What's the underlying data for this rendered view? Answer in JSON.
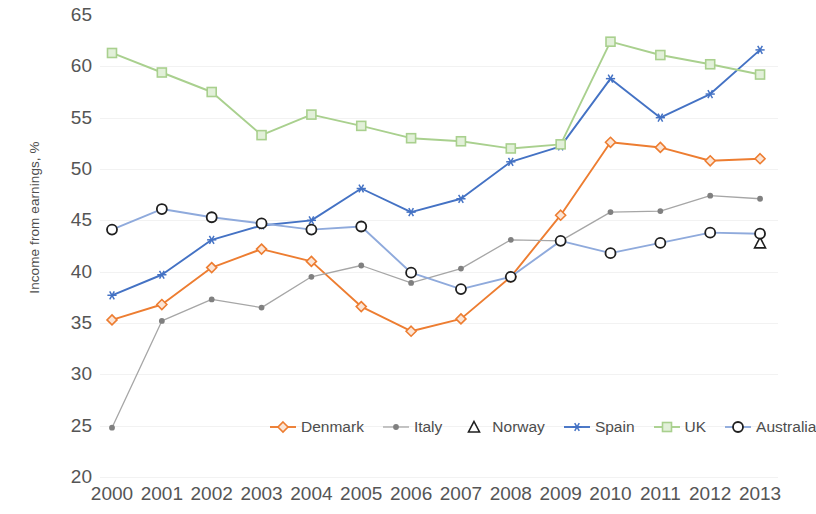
{
  "chart_data": {
    "type": "line",
    "title": "",
    "xlabel": "",
    "ylabel": "Income from earnings, %",
    "ylim": [
      20,
      65
    ],
    "ytick_step": 5,
    "yticks": [
      65,
      60,
      55,
      50,
      45,
      40,
      35,
      30,
      25,
      20
    ],
    "grid": true,
    "legend_position": "bottom",
    "categories": [
      "2000",
      "2001",
      "2002",
      "2003",
      "2004",
      "2005",
      "2006",
      "2007",
      "2008",
      "2009",
      "2010",
      "2011",
      "2012",
      "2013"
    ],
    "series": [
      {
        "name": "Denmark",
        "color": "#ED7D31",
        "marker": "diamond",
        "values": [
          35.3,
          36.8,
          40.4,
          42.2,
          41.0,
          36.6,
          34.2,
          35.4,
          39.5,
          45.5,
          52.6,
          52.1,
          50.8,
          51.0
        ]
      },
      {
        "name": "Italy",
        "color": "#A6A6A6",
        "marker": "dot",
        "values": [
          24.8,
          35.2,
          37.3,
          36.5,
          39.5,
          40.6,
          38.9,
          40.3,
          43.1,
          43.0,
          45.8,
          45.9,
          47.4,
          47.1
        ]
      },
      {
        "name": "Norway",
        "color": "#262626",
        "marker": "triangle",
        "values": [
          null,
          null,
          null,
          null,
          null,
          null,
          null,
          null,
          null,
          null,
          null,
          null,
          null,
          42.8
        ]
      },
      {
        "name": "Spain",
        "color": "#4472C4",
        "marker": "star",
        "values": [
          37.7,
          39.7,
          43.1,
          44.5,
          45.0,
          48.1,
          45.8,
          47.1,
          50.7,
          52.2,
          58.8,
          55.0,
          57.3,
          61.6
        ]
      },
      {
        "name": "UK",
        "color": "#A9D08E",
        "marker": "square",
        "values": [
          61.3,
          59.4,
          57.5,
          53.3,
          55.3,
          54.2,
          53.0,
          52.7,
          52.0,
          52.4,
          62.4,
          61.1,
          60.2,
          59.2
        ]
      },
      {
        "name": "Australia",
        "color": "#8FAADC",
        "marker": "circle",
        "values": [
          44.1,
          46.1,
          45.3,
          44.7,
          44.1,
          44.4,
          39.9,
          38.3,
          39.5,
          43.0,
          41.8,
          42.8,
          43.8,
          43.7
        ]
      }
    ]
  },
  "legend": {
    "items": [
      {
        "label": "Denmark"
      },
      {
        "label": "Italy"
      },
      {
        "label": "Norway"
      },
      {
        "label": "Spain"
      },
      {
        "label": "UK"
      },
      {
        "label": "Australia"
      }
    ]
  }
}
